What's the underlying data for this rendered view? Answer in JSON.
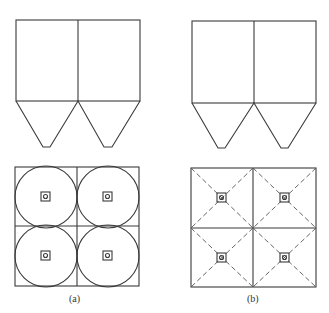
{
  "figure": {
    "panels": [
      {
        "id": "a",
        "label": "(a)",
        "elevation": "two bins with conical hoppers",
        "plan": "2x2 grid with inscribed circles and center outlets"
      },
      {
        "id": "b",
        "label": "(b)",
        "elevation": "two bins with pyramidal hoppers",
        "plan": "2x2 grid with dashed diagonal lines and center outlets"
      }
    ]
  }
}
